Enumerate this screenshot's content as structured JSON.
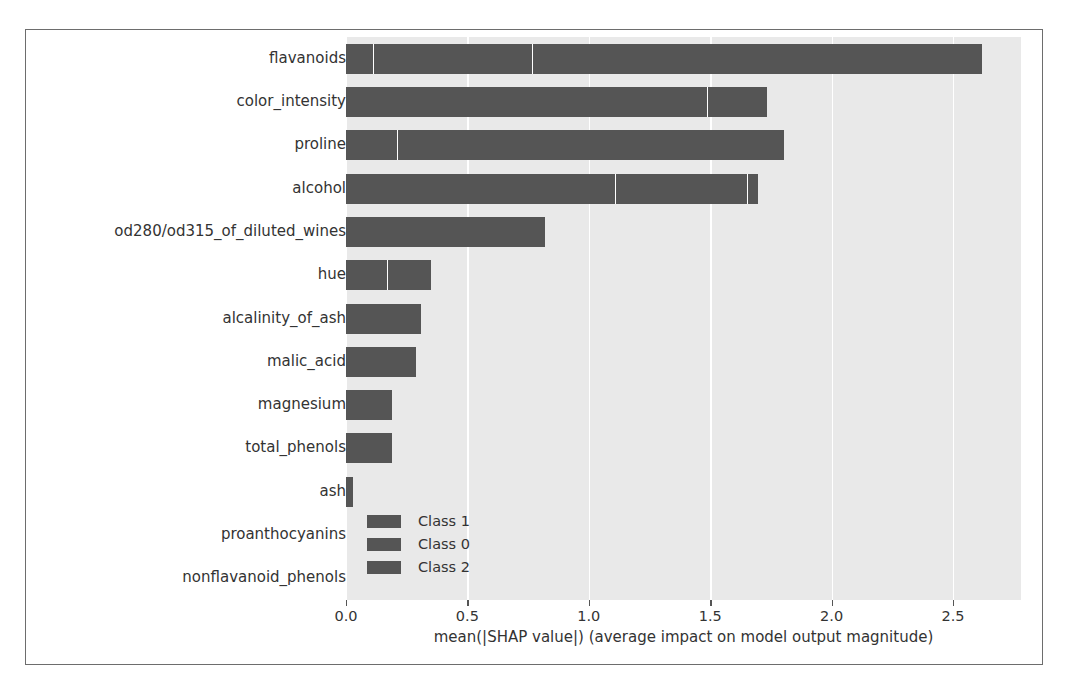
{
  "chart_data": {
    "type": "bar",
    "orientation": "horizontal",
    "stacked": true,
    "title": "",
    "xlabel": "mean(|SHAP value|) (average impact on model output magnitude)",
    "ylabel": "",
    "xlim": [
      0.0,
      2.78
    ],
    "xticks": [
      0.0,
      0.5,
      1.0,
      1.5,
      2.0,
      2.5
    ],
    "xticklabels": [
      "0.0",
      "0.5",
      "1.0",
      "1.5",
      "2.0",
      "2.5"
    ],
    "grid": true,
    "grid_axis": "x",
    "legend_position": "center-left",
    "categories": [
      "flavanoids",
      "color_intensity",
      "proline",
      "alcohol",
      "od280/od315_of_diluted_wines",
      "hue",
      "alcalinity_of_ash",
      "malic_acid",
      "magnesium",
      "total_phenols",
      "ash",
      "proanthocyanins",
      "nonflavanoid_phenols"
    ],
    "series": [
      {
        "name": "Class 1",
        "color": "#555555",
        "values": [
          0.115,
          1.49,
          0.215,
          1.11,
          0.82,
          0.175,
          0.31,
          0.29,
          0.19,
          0.19,
          0.03,
          0.0,
          0.0
        ]
      },
      {
        "name": "Class 0",
        "color": "#555555",
        "values": [
          0.655,
          0.245,
          1.59,
          0.545,
          0.0,
          0.175,
          0.0,
          0.0,
          0.0,
          0.0,
          0.0,
          0.0,
          0.0
        ]
      },
      {
        "name": "Class 2",
        "color": "#555555",
        "values": [
          1.85,
          0.0,
          0.0,
          0.04,
          0.0,
          0.0,
          0.0,
          0.0,
          0.0,
          0.0,
          0.0,
          0.0,
          0.0
        ]
      }
    ],
    "totals": [
      2.62,
      1.735,
      1.805,
      1.695,
      0.82,
      0.35,
      0.31,
      0.29,
      0.19,
      0.19,
      0.03,
      0.0,
      0.0
    ]
  },
  "colors": {
    "plot_background": "#e9e9e9",
    "bar": "#555555",
    "gridline": "#ffffff",
    "frame": "#6d6d6d",
    "text": "#333333",
    "page_background": "#ffffff"
  }
}
